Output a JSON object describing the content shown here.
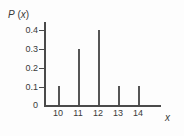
{
  "chart_data": {
    "type": "bar",
    "title": "",
    "subtitle": "",
    "xlabel": "x",
    "ylabel": "P (x)",
    "ylabel_parts": {
      "symbol": "P",
      "open": " (",
      "variable": "x",
      "close": ")"
    },
    "categories": [
      "10",
      "11",
      "12",
      "13",
      "14"
    ],
    "x": [
      10,
      11,
      12,
      13,
      14
    ],
    "values": [
      0.1,
      0.3,
      0.4,
      0.1,
      0.1
    ],
    "series": [
      {
        "name": "P(x)",
        "values": [
          0.1,
          0.3,
          0.4,
          0.1,
          0.1
        ]
      }
    ],
    "ylim": [
      0,
      0.4
    ],
    "xlim": [
      9.3,
      15.0
    ],
    "ytick_labels": [
      "0.4",
      "0.3",
      "0.2",
      "0.1",
      "0"
    ],
    "ytick_values": [
      0.4,
      0.3,
      0.2,
      0.1,
      0
    ],
    "xtick_labels": [
      "10",
      "11",
      "12",
      "13",
      "14"
    ],
    "xtick_values": [
      10,
      11,
      12,
      13,
      14
    ],
    "grid": false,
    "legend": null,
    "annotations": [],
    "style": {
      "axis_color": "#4a4a4a",
      "spike_color": "#555555",
      "text_color": "#3a3a3a",
      "background": "#fdfdfd"
    }
  }
}
